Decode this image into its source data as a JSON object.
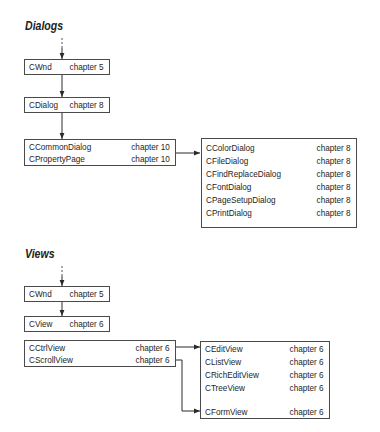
{
  "dialogs": {
    "title": "Dialogs",
    "chain": [
      {
        "name": "CWnd",
        "chapter": "chapter 5"
      },
      {
        "name": "CDialog",
        "chapter": "chapter 8"
      }
    ],
    "common_group": [
      {
        "name": "CCommonDialog",
        "chapter": "chapter 10"
      },
      {
        "name": "CPropertyPage",
        "chapter": "chapter 10"
      }
    ],
    "derived_group": [
      {
        "name": "CColorDialog",
        "chapter": "chapter 8"
      },
      {
        "name": "CFileDialog",
        "chapter": "chapter 8"
      },
      {
        "name": "CFindReplaceDialog",
        "chapter": "chapter 8"
      },
      {
        "name": "CFontDialog",
        "chapter": "chapter 8"
      },
      {
        "name": "CPageSetupDialog",
        "chapter": "chapter 8"
      },
      {
        "name": "CPrintDialog",
        "chapter": "chapter 8"
      }
    ]
  },
  "views": {
    "title": "Views",
    "chain": [
      {
        "name": "CWnd",
        "chapter": "chapter 5"
      },
      {
        "name": "CView",
        "chapter": "chapter 6"
      }
    ],
    "base_group": [
      {
        "name": "CCtrlView",
        "chapter": "chapter 6"
      },
      {
        "name": "CScrollView",
        "chapter": "chapter 6"
      }
    ],
    "derived_group": [
      {
        "name": "CEditView",
        "chapter": "chapter 6"
      },
      {
        "name": "CListView",
        "chapter": "chapter 6"
      },
      {
        "name": "CRichEditView",
        "chapter": "chapter 6"
      },
      {
        "name": "CTreeView",
        "chapter": "chapter 6"
      },
      {
        "name": "CFormView",
        "chapter": "chapter 6"
      }
    ]
  },
  "colors": {
    "line": "#3a3a3a",
    "text": "#1e1e1e",
    "background": "#ffffff"
  }
}
